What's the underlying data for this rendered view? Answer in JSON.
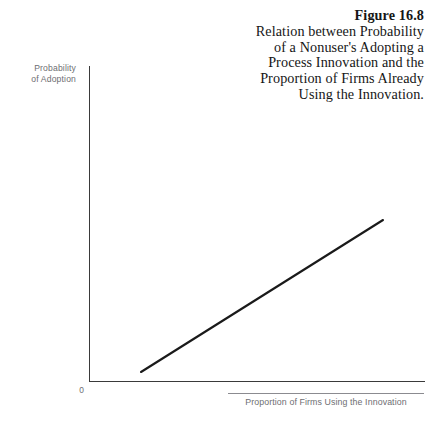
{
  "figure": {
    "caption_lines": [
      "Figure 16.8",
      "Relation between Probability",
      "of a Nonuser's Adopting a",
      "Process Innovation and the",
      "Proportion of Firms Already",
      "Using the Innovation."
    ],
    "background_color": "#ffffff",
    "axis_color": "#3a3a3a",
    "label_color": "#6e6e72",
    "line_color": "#1a1a1a"
  },
  "axes": {
    "y_label_line1": "Probability",
    "y_label_line2": "of Adoption",
    "x_label": "Proportion of Firms Using the Innovation",
    "origin_label": "0"
  },
  "chart_data": {
    "type": "line",
    "title": "Relation between Probability of a Nonuser's Adopting a Process Innovation and the Proportion of Firms Already Using the Innovation.",
    "xlabel": "Proportion of Firms Using the Innovation",
    "ylabel": "Probability of Adoption",
    "grid": false,
    "legend": null,
    "xlim": [
      0,
      1
    ],
    "ylim": [
      0,
      1
    ],
    "x_ticks": [
      "0"
    ],
    "y_ticks": [],
    "series": [
      {
        "name": "Probability of Adoption",
        "x": [
          0.155,
          1.0
        ],
        "y": [
          0.027,
          0.51
        ],
        "pixel_start": [
          141,
          372
        ],
        "pixel_end": [
          383,
          220
        ]
      }
    ]
  }
}
